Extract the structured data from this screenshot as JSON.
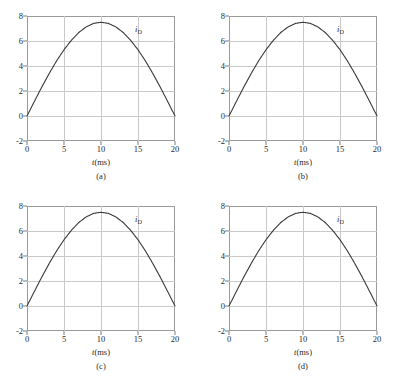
{
  "figure": {
    "layout": "2x2",
    "background_color": "#ffffff",
    "frame_color": "#9a9a9a",
    "grid_color": "#c9c9c9",
    "curve_color": "#3a3a3a"
  },
  "panels": [
    {
      "caption": "(a)",
      "curve_label": "i",
      "curve_label_sub": "D",
      "xlabel_var": "t",
      "xlabel_unit": "(ms)"
    },
    {
      "caption": "(b)",
      "curve_label": "i",
      "curve_label_sub": "D",
      "xlabel_var": "t",
      "xlabel_unit": "(ms)"
    },
    {
      "caption": "(c)",
      "curve_label": "i",
      "curve_label_sub": "D",
      "xlabel_var": "t",
      "xlabel_unit": "(ms)"
    },
    {
      "caption": "(d)",
      "curve_label": "i",
      "curve_label_sub": "D",
      "xlabel_var": "t",
      "xlabel_unit": "(ms)"
    }
  ],
  "chart_data": [
    {
      "type": "line",
      "title": "(a)",
      "xlabel": "t(ms)",
      "ylabel": "",
      "series_label": "iD",
      "xlim": [
        0,
        20
      ],
      "ylim": [
        -2,
        8
      ],
      "xticks": [
        0,
        5,
        10,
        15,
        20
      ],
      "yticks": [
        -2,
        0,
        2,
        4,
        6,
        8
      ],
      "grid": true,
      "legend_position": "inside-top-right",
      "x": [
        0,
        1,
        2,
        3,
        4,
        5,
        6,
        7,
        8,
        9,
        10,
        11,
        12,
        13,
        14,
        15,
        16,
        17,
        18,
        19,
        20
      ],
      "values": [
        0,
        1.17,
        2.32,
        3.4,
        4.41,
        5.3,
        6.06,
        6.68,
        7.13,
        7.41,
        7.5,
        7.41,
        7.13,
        6.68,
        6.06,
        5.3,
        4.41,
        3.4,
        2.32,
        1.17,
        0
      ]
    },
    {
      "type": "line",
      "title": "(b)",
      "xlabel": "t(ms)",
      "ylabel": "",
      "series_label": "iD",
      "xlim": [
        0,
        20
      ],
      "ylim": [
        -2,
        8
      ],
      "xticks": [
        0,
        5,
        10,
        15,
        20
      ],
      "yticks": [
        -2,
        0,
        2,
        4,
        6,
        8
      ],
      "grid": true,
      "legend_position": "inside-top-right",
      "x": [
        0,
        1,
        2,
        3,
        4,
        5,
        6,
        7,
        8,
        9,
        10,
        11,
        12,
        13,
        14,
        15,
        16,
        17,
        18,
        19,
        20
      ],
      "values": [
        0,
        1.17,
        2.32,
        3.4,
        4.41,
        5.3,
        6.06,
        6.68,
        7.13,
        7.41,
        7.5,
        7.41,
        7.13,
        6.68,
        6.06,
        5.3,
        4.41,
        3.4,
        2.32,
        1.17,
        0
      ]
    },
    {
      "type": "line",
      "title": "(c)",
      "xlabel": "t(ms)",
      "ylabel": "",
      "series_label": "iD",
      "xlim": [
        0,
        20
      ],
      "ylim": [
        -2,
        8
      ],
      "xticks": [
        0,
        5,
        10,
        15,
        20
      ],
      "yticks": [
        -2,
        0,
        2,
        4,
        6,
        8
      ],
      "grid": true,
      "legend_position": "inside-top-right",
      "x": [
        0,
        1,
        2,
        3,
        4,
        5,
        6,
        7,
        8,
        9,
        10,
        11,
        12,
        13,
        14,
        15,
        16,
        17,
        18,
        19,
        20
      ],
      "values": [
        0,
        1.17,
        2.32,
        3.4,
        4.41,
        5.3,
        6.06,
        6.68,
        7.13,
        7.41,
        7.5,
        7.41,
        7.13,
        6.68,
        6.06,
        5.3,
        4.41,
        3.4,
        2.32,
        1.17,
        0
      ]
    },
    {
      "type": "line",
      "title": "(d)",
      "xlabel": "t(ms)",
      "ylabel": "",
      "series_label": "iD",
      "xlim": [
        0,
        20
      ],
      "ylim": [
        -2,
        8
      ],
      "xticks": [
        0,
        5,
        10,
        15,
        20
      ],
      "yticks": [
        -2,
        0,
        2,
        4,
        6,
        8
      ],
      "grid": true,
      "legend_position": "inside-top-right",
      "x": [
        0,
        1,
        2,
        3,
        4,
        5,
        6,
        7,
        8,
        9,
        10,
        11,
        12,
        13,
        14,
        15,
        16,
        17,
        18,
        19,
        20
      ],
      "values": [
        0,
        1.17,
        2.32,
        3.4,
        4.41,
        5.3,
        6.06,
        6.68,
        7.13,
        7.41,
        7.5,
        7.41,
        7.13,
        6.68,
        6.06,
        5.3,
        4.41,
        3.4,
        2.32,
        1.17,
        0
      ]
    }
  ]
}
